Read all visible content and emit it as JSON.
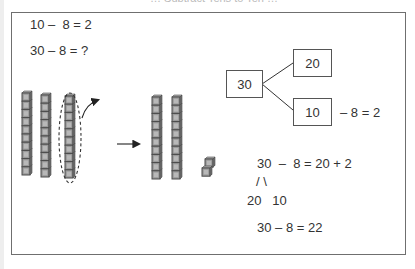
{
  "top_caption": "… Subtract Tens to Ten …",
  "equations_left": {
    "line1": "10 –  8 = 2",
    "line2": "30 – 8 = ?"
  },
  "blocks": {
    "start_rods": 3,
    "cubes_per_rod": 10,
    "circled_rod_index": 2,
    "result_rods": 2,
    "result_units": 2,
    "icons": [
      "base-ten-rod",
      "unit-cube",
      "dashed-ellipse",
      "curved-arrow",
      "right-arrow"
    ]
  },
  "tree": {
    "root": "30",
    "top_branch": "20",
    "bottom_branch": "10",
    "bottom_note": "– 8 = 2"
  },
  "equations_right": {
    "line1": "30  –  8 = 20 + 2",
    "split": "/ \\",
    "parts": "20   10",
    "answer": "30 – 8 = 22"
  },
  "colors": {
    "frame": "#6f6f6f",
    "text": "#333333",
    "cube_fill": "#9a9a9a",
    "cube_edge": "#4a4a4a"
  }
}
